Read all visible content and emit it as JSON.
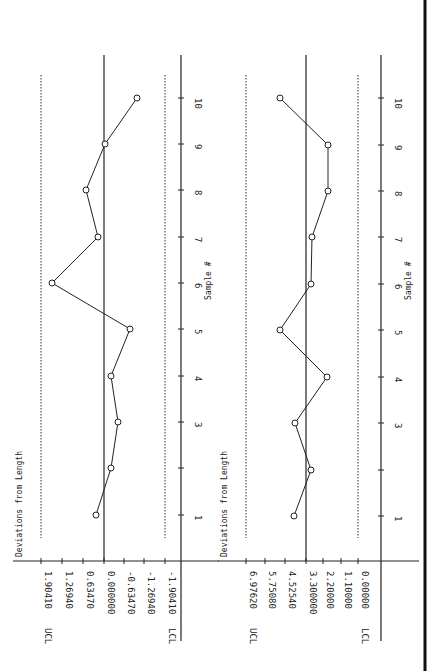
{
  "page": {
    "orientation": "rotated 90deg clockwise scan",
    "border_color": "#111111"
  },
  "chart_data": [
    {
      "type": "line",
      "title": "Deviations from Length",
      "xlabel": "Sample #",
      "ylabel": "Deviations from Length",
      "x": [
        1,
        2,
        3,
        4,
        5,
        6,
        7,
        8,
        9,
        10
      ],
      "x_tick_labels": [
        "1",
        "",
        "3",
        "4",
        "5",
        "6",
        "7",
        "8",
        "9",
        "10"
      ],
      "y_tick_labels": [
        "1.90410",
        "1.26940",
        "0.63470",
        "0.000000",
        "-0.63470",
        "-1.26940",
        "-1.90410"
      ],
      "ylim": [
        -1.9041,
        1.9041
      ],
      "center_line": 0.0,
      "ucl": {
        "label": "UCL",
        "value": 1.9041
      },
      "lcl": {
        "label": "LCL",
        "value": -1.9041
      },
      "series": [
        {
          "name": "Deviations from Length",
          "values": [
            0.25,
            -0.22,
            -0.44,
            -0.22,
            -0.8,
            1.57,
            0.19,
            0.56,
            -0.03,
            -1.0
          ]
        }
      ],
      "grid": false,
      "limit_lines_style": "dotted"
    },
    {
      "type": "line",
      "title": "Deviations from Length",
      "xlabel": "Sample #",
      "ylabel": "Deviations from Length",
      "x": [
        1,
        2,
        3,
        4,
        5,
        6,
        7,
        8,
        9,
        10
      ],
      "x_tick_labels": [
        "1",
        "",
        "3",
        "4",
        "5",
        "6",
        "7",
        "8",
        "9",
        "10"
      ],
      "y_tick_labels": [
        "6.97620",
        "5.75080",
        "4.52540",
        "3.300000",
        "2.20000",
        "1.10000",
        "0.00000"
      ],
      "ylim": [
        0.0,
        6.9762
      ],
      "center_line": 3.3,
      "ucl": {
        "label": "UCL",
        "value": 6.9762
      },
      "lcl": {
        "label": "LCL",
        "value": 0.0
      },
      "series": [
        {
          "name": "Deviations from Length",
          "values": [
            4.05,
            2.95,
            4.0,
            1.9,
            4.95,
            2.95,
            2.85,
            1.8,
            1.8,
            4.95
          ]
        }
      ],
      "grid": false,
      "limit_lines_style": "dotted"
    }
  ],
  "charts": [
    {
      "title": "Deviations from Length",
      "xlabel": "Sample #",
      "ucl_label": "UCL",
      "lcl_label": "LCL",
      "axis_x": 181,
      "base_y": 561,
      "center_x": 104,
      "ucl_x": 41,
      "lcl_x": 165,
      "value_ticks": [
        {
          "x": 41,
          "label": "1.90410"
        },
        {
          "x": 62,
          "label": "1.26940"
        },
        {
          "x": 83,
          "label": "0.63470"
        },
        {
          "x": 104,
          "label": "0.000000"
        },
        {
          "x": 124,
          "label": "-0.63470"
        },
        {
          "x": 144,
          "label": "-1.26940"
        },
        {
          "x": 165,
          "label": "-1.90410"
        }
      ],
      "points": [
        {
          "s": "1",
          "y": 515,
          "x": 96
        },
        {
          "s": "",
          "y": 468,
          "x": 111
        },
        {
          "s": "3",
          "y": 422,
          "x": 118
        },
        {
          "s": "4",
          "y": 376,
          "x": 111
        },
        {
          "s": "5",
          "y": 329,
          "x": 130
        },
        {
          "s": "6",
          "y": 283,
          "x": 52
        },
        {
          "s": "7",
          "y": 237,
          "x": 98
        },
        {
          "s": "8",
          "y": 190,
          "x": 86
        },
        {
          "s": "9",
          "y": 144,
          "x": 105
        },
        {
          "s": "10",
          "y": 98,
          "x": 137
        }
      ]
    },
    {
      "title": "Deviations from Length",
      "xlabel": "Sample #",
      "ucl_label": "UCL",
      "lcl_label": "LCL",
      "axis_x": 381,
      "base_y": 561,
      "center_x": 306,
      "ucl_x": 246,
      "lcl_x": 358,
      "value_ticks": [
        {
          "x": 246,
          "label": "6.97620"
        },
        {
          "x": 265,
          "label": "5.75080"
        },
        {
          "x": 285,
          "label": "4.52540"
        },
        {
          "x": 306,
          "label": "3.300000"
        },
        {
          "x": 323,
          "label": "2.20000"
        },
        {
          "x": 341,
          "label": "1.10000"
        },
        {
          "x": 358,
          "label": "0.00000"
        }
      ],
      "points": [
        {
          "s": "1",
          "y": 516,
          "x": 294
        },
        {
          "s": "",
          "y": 470,
          "x": 311
        },
        {
          "s": "3",
          "y": 423,
          "x": 295
        },
        {
          "s": "4",
          "y": 377,
          "x": 327
        },
        {
          "s": "5",
          "y": 330,
          "x": 280
        },
        {
          "s": "6",
          "y": 284,
          "x": 311
        },
        {
          "s": "7",
          "y": 237,
          "x": 312
        },
        {
          "s": "8",
          "y": 191,
          "x": 328
        },
        {
          "s": "9",
          "y": 145,
          "x": 328
        },
        {
          "s": "10",
          "y": 98,
          "x": 280
        }
      ]
    }
  ]
}
